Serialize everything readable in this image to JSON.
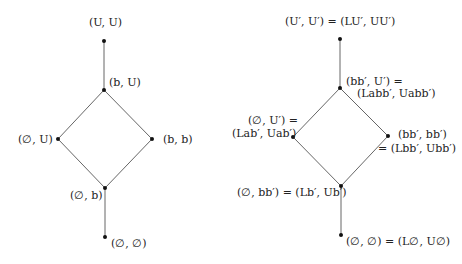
{
  "diagrams": [
    {
      "name": "left-lattice",
      "nodes": [
        {
          "id": "top",
          "x": 104,
          "y": 41,
          "label": "(U,U)"
        },
        {
          "id": "bU",
          "x": 104,
          "y": 90,
          "label": "(b,U)"
        },
        {
          "id": "emptyU",
          "x": 58,
          "y": 139,
          "label": "(∅,U)"
        },
        {
          "id": "bb",
          "x": 152,
          "y": 139,
          "label": "(b,b)"
        },
        {
          "id": "emptyb",
          "x": 105,
          "y": 188,
          "label": "(∅,b)"
        },
        {
          "id": "bottom",
          "x": 105,
          "y": 237,
          "label": "(∅,∅)"
        }
      ],
      "edges": [
        [
          "top",
          "bU"
        ],
        [
          "bU",
          "emptyU"
        ],
        [
          "bU",
          "bb"
        ],
        [
          "emptyU",
          "emptyb"
        ],
        [
          "bb",
          "emptyb"
        ],
        [
          "emptyb",
          "bottom"
        ]
      ]
    },
    {
      "name": "right-lattice",
      "nodes": [
        {
          "id": "top",
          "x": 340,
          "y": 39,
          "label": "(U′,U′) = (LU′, UU′)"
        },
        {
          "id": "bbU",
          "x": 340,
          "y": 88,
          "label_line1": "(bb′,U′) =",
          "label_line2": "(Labb′, Uabb′)"
        },
        {
          "id": "emptyU",
          "x": 293,
          "y": 137,
          "label_line1": "(∅,U′) =",
          "label_line2": "(Lab′, Uab′)"
        },
        {
          "id": "bbbb",
          "x": 388,
          "y": 136,
          "label_line1": "(bb′,bb′)",
          "label_line2": "= (Lbb′, Ubb′)"
        },
        {
          "id": "emptybb",
          "x": 341,
          "y": 186,
          "label": "(∅,bb′) = (Lb′, Ub′)"
        },
        {
          "id": "bottom",
          "x": 341,
          "y": 235,
          "label": "(∅,∅) = (L∅, U∅)"
        }
      ],
      "edges": [
        [
          "top",
          "bbU"
        ],
        [
          "bbU",
          "emptyU"
        ],
        [
          "bbU",
          "bbbb"
        ],
        [
          "emptyU",
          "emptybb"
        ],
        [
          "bbbb",
          "emptybb"
        ],
        [
          "emptybb",
          "bottom"
        ]
      ]
    }
  ],
  "labels": {
    "l_top": "(U, U)",
    "l_bU": "(b, U)",
    "l_emptyU": "(∅, U)",
    "l_bb": "(b, b)",
    "l_emptyb": "(∅, b)",
    "l_bottom": "(∅, ∅)",
    "r_top": "(U′, U′) = (LU′, UU′)",
    "r_bbU_1": "(bb′, U′) =",
    "r_bbU_2": "(Labb′, Uabb′)",
    "r_emptyU_1": "(∅, U′) =",
    "r_emptyU_2": "(Lab′, Uab′)",
    "r_bbbb_1": "(bb′, bb′)",
    "r_bbbb_2": "= (Lbb′, Ubb′)",
    "r_emptybb": "(∅, bb′) = (Lb′, Ub′)",
    "r_bottom": "(∅, ∅) = (L∅, U∅)"
  },
  "colors": {
    "edge": "#555555",
    "node": "#111111",
    "text": "#222222"
  }
}
